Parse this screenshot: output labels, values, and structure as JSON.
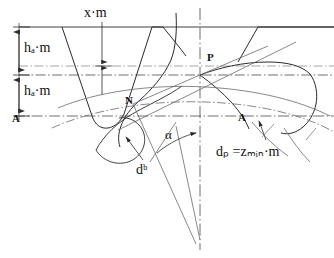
{
  "diagram": {
    "type": "engineering-line-drawing",
    "canvas": {
      "width": 334,
      "height": 258
    },
    "colors": {
      "line": "#2b2b2b",
      "thin_line": "#6a6a6a",
      "center_line": "#4a4a4a",
      "background": "#ffffff",
      "text": "#111111"
    },
    "labels": {
      "addendum_shift": "x·m",
      "addendum_upper": "hₐ·m",
      "addendum_lower": "hₐ·m",
      "point_A_left": "A",
      "point_N": "N",
      "point_P": "P",
      "point_A_right": "A",
      "pressure_angle": "α",
      "base_diameter": "dᵇ",
      "pitch_diameter": "dₚ =zₘᵢₙ·m"
    },
    "label_parts": {
      "ha_base": "h",
      "ha_sub": "a",
      "ha_suffix": "·m",
      "db_base": "d",
      "db_sub": "b",
      "dp_base": "d",
      "dp_sub": "p",
      "dp_eq": "=z",
      "dp_sub2": "min",
      "dp_suffix": "·m",
      "xm_text": "x·m"
    },
    "dimension_lines": {
      "vertical_axis_x": 19,
      "top_line_y": 27,
      "pitch_line_y": 75,
      "base_line_y": 116,
      "xm_arrow_x": 102,
      "xm_arrow_top_y": 22,
      "xm_arrow_bottom_y": 95
    },
    "geometry": {
      "vertical_centerline_x": 200,
      "pitch_point": {
        "x": 200,
        "y": 75
      },
      "point_N": {
        "x": 133,
        "y": 104
      },
      "point_A_right": {
        "x": 248,
        "y": 113
      },
      "pressure_angle_deg": 20
    }
  }
}
